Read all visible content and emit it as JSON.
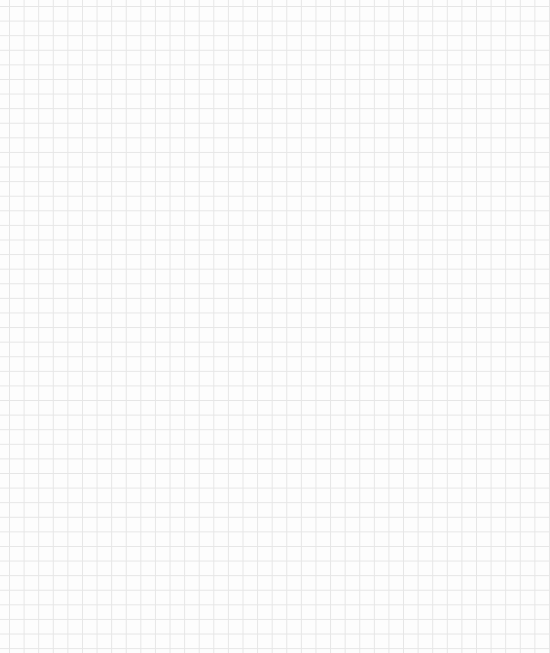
{
  "canvas": {
    "type": "grid-paper",
    "background_color": "#fdfdfd",
    "grid_line_color": "#e6e6e6",
    "grid_spacing_px": 14.6,
    "width": 550,
    "height": 653
  }
}
